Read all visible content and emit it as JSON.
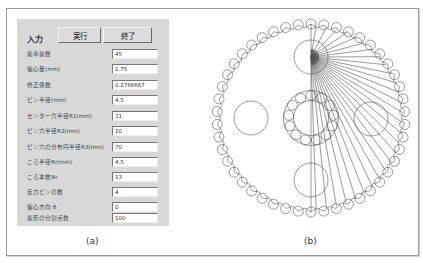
{
  "panel_a": {
    "title": "入力",
    "buttons": {
      "run": "実行",
      "exit": "終了"
    },
    "fields": [
      {
        "label": "歯車歯数",
        "value": "45"
      },
      {
        "label": "偏心量(mm)",
        "value": "1.75"
      },
      {
        "label": "修正係数",
        "value": "0.2766667"
      },
      {
        "label": "ピン半径(mm)",
        "value": "4.5"
      },
      {
        "label": "センター穴半径R1(mm)",
        "value": "31"
      },
      {
        "label": "ピン穴半径R2(mm)",
        "value": "20"
      },
      {
        "label": "ピン穴の分布円半径R3(mm)",
        "value": "70"
      },
      {
        "label": "ころ半径Rr(mm)",
        "value": "4.5"
      },
      {
        "label": "ころ本数Nr",
        "value": "13"
      },
      {
        "label": "反力ピンの数",
        "value": "4"
      },
      {
        "label": "偏心方向 θ",
        "value": "0"
      },
      {
        "label": "歯形の分割点数",
        "value": "100"
      }
    ],
    "caption": "(a)"
  },
  "panel_b": {
    "caption": "(b)",
    "diagram": {
      "outer_pin_count": 46,
      "bearing_roller_count": 13,
      "pin_hole_count": 4,
      "ray_count": 28,
      "stroke_color": "#555555"
    }
  }
}
